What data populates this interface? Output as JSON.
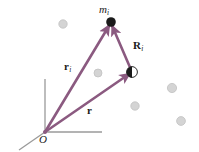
{
  "figure": {
    "width": 199,
    "height": 152,
    "background_color": "#FFFFFF"
  },
  "colors": {
    "vector": "#8B5A80",
    "vector_dark": "#7A4A70",
    "axis": "#9A9A9A",
    "particle": "#1A1A1A",
    "cloud_particle": "#D0D0D0",
    "cloud_particle_stroke": "#BDBDBD",
    "label": "#1A1A1A"
  },
  "labels": {
    "mass": {
      "base": "m",
      "sub": "i",
      "style": "italic",
      "x": 99,
      "y": 4
    },
    "vector_R": {
      "base": "R",
      "sub": "i",
      "style": "bold",
      "x": 133,
      "y": 40
    },
    "vector_r_i": {
      "base": "r",
      "sub": "i",
      "style": "bold",
      "x": 64,
      "y": 61
    },
    "vector_r": {
      "base": "r",
      "sub": "",
      "style": "bold",
      "x": 87,
      "y": 105
    },
    "origin": {
      "base": "O",
      "sub": "",
      "style": "italic",
      "x": 39,
      "y": 134
    }
  },
  "points": {
    "origin": {
      "x": 45,
      "y": 132
    },
    "mass_i": {
      "x": 111,
      "y": 22
    },
    "center_of_mass": {
      "x": 132,
      "y": 72
    }
  },
  "axes": [
    {
      "name": "y-axis",
      "x1": 45,
      "y1": 132,
      "x2": 45,
      "y2": 79
    },
    {
      "name": "x-axis",
      "x1": 45,
      "y1": 132,
      "x2": 102,
      "y2": 132
    },
    {
      "name": "z-axis",
      "x1": 45,
      "y1": 132,
      "x2": 20,
      "y2": 150
    }
  ],
  "vectors": [
    {
      "name": "r_i",
      "from": "origin",
      "to": "mass_i",
      "x1": 45,
      "y1": 132,
      "x2": 111,
      "y2": 22
    },
    {
      "name": "r",
      "from": "origin",
      "to": "center_of_mass",
      "x1": 45,
      "y1": 132,
      "x2": 132,
      "y2": 72
    },
    {
      "name": "R_i",
      "from": "center_of_mass",
      "to": "mass_i",
      "x1": 132,
      "y1": 72,
      "x2": 111,
      "y2": 22
    }
  ],
  "cloud_particles": [
    {
      "x": 63,
      "y": 24,
      "r": 4.2
    },
    {
      "x": 98,
      "y": 73,
      "r": 4.0
    },
    {
      "x": 172,
      "y": 88,
      "r": 4.6
    },
    {
      "x": 135,
      "y": 106,
      "r": 4.2
    },
    {
      "x": 181,
      "y": 121,
      "r": 4.4
    }
  ],
  "markers": {
    "mass_point": {
      "x": 111,
      "y": 22,
      "r": 4.6,
      "fill": "#1A1A1A"
    },
    "com_symbol": {
      "x": 132,
      "y": 72,
      "r": 5.4,
      "description": "center-of-mass-symbol"
    },
    "origin_dot": {
      "x": 45,
      "y": 132,
      "r": 1.8
    }
  }
}
